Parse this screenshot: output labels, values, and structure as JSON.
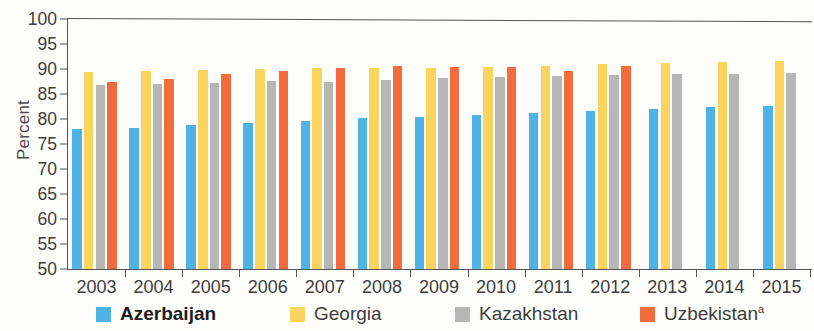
{
  "chart_data": {
    "type": "bar",
    "title": "",
    "xlabel": "",
    "ylabel": "Percent",
    "ylim": [
      50,
      100
    ],
    "ytick_step": 5,
    "yticks": [
      50,
      55,
      60,
      65,
      70,
      75,
      80,
      85,
      90,
      95,
      100
    ],
    "grid": false,
    "legend_position": "bottom",
    "categories": [
      "2003",
      "2004",
      "2005",
      "2006",
      "2007",
      "2008",
      "2009",
      "2010",
      "2011",
      "2012",
      "2013",
      "2014",
      "2015"
    ],
    "series": [
      {
        "name": "Azerbaijan",
        "color": "#4FB3E5",
        "emphasis": "bold",
        "values": [
          78.0,
          78.3,
          78.9,
          79.2,
          79.7,
          80.3,
          80.5,
          80.9,
          81.2,
          81.7,
          82.0,
          82.5,
          82.7
        ]
      },
      {
        "name": "Georgia",
        "color": "#FBD45E",
        "emphasis": "normal",
        "values": [
          89.4,
          89.7,
          89.9,
          90.0,
          90.2,
          90.3,
          90.3,
          90.5,
          90.7,
          91.0,
          91.2,
          91.4,
          91.7
        ]
      },
      {
        "name": "Kazakhstan",
        "color": "#B6B6B6",
        "emphasis": "normal",
        "values": [
          86.9,
          87.0,
          87.3,
          87.6,
          87.5,
          87.8,
          88.2,
          88.5,
          88.7,
          88.9,
          89.0,
          89.0,
          89.3
        ]
      },
      {
        "name": "Uzbekistan",
        "superscript": "a",
        "color": "#F26C3E",
        "emphasis": "normal",
        "values": [
          87.5,
          88.1,
          89.1,
          89.6,
          90.2,
          90.6,
          90.4,
          90.5,
          89.7,
          90.6,
          null,
          null,
          null
        ]
      }
    ]
  },
  "legend": {
    "items": [
      {
        "label": "Azerbaijan",
        "superscript": "",
        "color": "#4FB3E5",
        "bold": true
      },
      {
        "label": "Georgia",
        "superscript": "",
        "color": "#FBD45E",
        "bold": false
      },
      {
        "label": "Kazakhstan",
        "superscript": "",
        "color": "#B6B6B6",
        "bold": false
      },
      {
        "label": "Uzbekistan",
        "superscript": "a",
        "color": "#F26C3E",
        "bold": false
      }
    ]
  },
  "axis": {
    "y_title": "Percent"
  }
}
